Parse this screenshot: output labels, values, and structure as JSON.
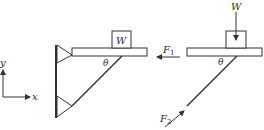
{
  "diagram": {
    "type": "statics free-body diagram",
    "coordinate_axes": {
      "x_label": "x",
      "y_label": "y"
    },
    "left_figure": {
      "description": "Wall-mounted bracket: horizontal beam supporting block W, braced by inclined rod at angle theta, both pinned to wall",
      "block_label": "W",
      "angle_label": "θ"
    },
    "right_figure": {
      "description": "Free-body diagram of the beam with block",
      "weight_label": "W",
      "force1": {
        "name": "F",
        "subscript": "1",
        "direction": "left"
      },
      "force2": {
        "name": "F",
        "subscript": "2",
        "direction": "up-right along rod"
      },
      "angle_label": "θ"
    },
    "colors": {
      "line": "#333333",
      "background": "#ffffff"
    }
  }
}
